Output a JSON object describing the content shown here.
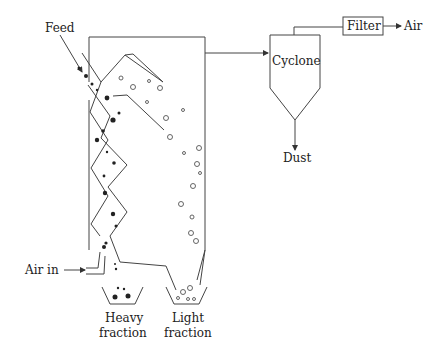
{
  "diagram": {
    "labels": {
      "feed": "Feed",
      "cyclone": "Cyclone",
      "filter": "Filter",
      "air_out": "Air",
      "dust": "Dust",
      "air_in": "Air in",
      "heavy_line1": "Heavy",
      "heavy_line2": "fraction",
      "light_line1": "Light",
      "light_line2": "fraction"
    },
    "nodes": [
      {
        "id": "feed",
        "label": "Feed"
      },
      {
        "id": "classifier",
        "label": ""
      },
      {
        "id": "cyclone",
        "label": "Cyclone"
      },
      {
        "id": "filter",
        "label": "Filter"
      },
      {
        "id": "air_out",
        "label": "Air"
      },
      {
        "id": "dust",
        "label": "Dust"
      },
      {
        "id": "air_in",
        "label": "Air in"
      },
      {
        "id": "heavy_fraction",
        "label": "Heavy fraction"
      },
      {
        "id": "light_fraction",
        "label": "Light fraction"
      }
    ],
    "edges": [
      {
        "from": "feed",
        "to": "classifier"
      },
      {
        "from": "air_in",
        "to": "classifier"
      },
      {
        "from": "classifier",
        "to": "cyclone"
      },
      {
        "from": "cyclone",
        "to": "filter"
      },
      {
        "from": "filter",
        "to": "air_out"
      },
      {
        "from": "cyclone",
        "to": "dust"
      },
      {
        "from": "classifier",
        "to": "heavy_fraction"
      },
      {
        "from": "classifier",
        "to": "light_fraction"
      }
    ]
  }
}
